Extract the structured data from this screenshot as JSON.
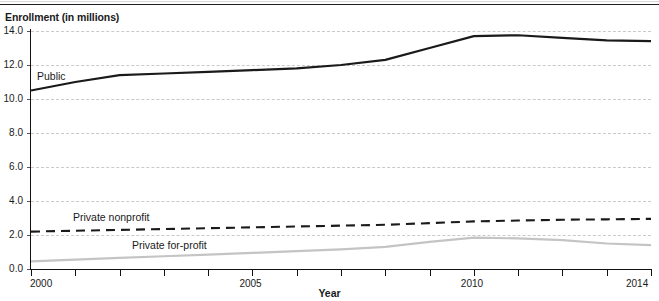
{
  "figure": {
    "y_axis_caption": "Enrollment (in millions)",
    "x_axis_caption": "Year"
  },
  "series_labels": {
    "public": "Public",
    "private_nonprofit": "Private nonprofit",
    "private_for_profit": "Private for-profit"
  },
  "axis": {
    "y_ticks": [
      "0.0",
      "2.0",
      "4.0",
      "6.0",
      "8.0",
      "10.0",
      "12.0",
      "14.0"
    ],
    "x_ticks_labeled": [
      "2000",
      "2005",
      "2010",
      "2014"
    ]
  },
  "colors": {
    "public_line": "#1a1a1a",
    "nonprofit_line": "#1a1a1a",
    "forprofit_line": "#c4c4c4",
    "gridline": "#c9c9c9",
    "axis": "#111111",
    "text": "#1a1a1a"
  },
  "chart_data": {
    "type": "line",
    "title": "Enrollment (in millions)",
    "xlabel": "Year",
    "ylabel": "Enrollment (in millions)",
    "xlim": [
      2000,
      2014
    ],
    "ylim": [
      0.0,
      14.0
    ],
    "ytick_step": 2.0,
    "grid": true,
    "legend": "inline-labels",
    "x": [
      2000,
      2001,
      2002,
      2003,
      2004,
      2005,
      2006,
      2007,
      2008,
      2009,
      2010,
      2011,
      2012,
      2013,
      2014
    ],
    "series": [
      {
        "name": "Public",
        "style": "solid",
        "color": "#1a1a1a",
        "values": [
          10.5,
          11.0,
          11.4,
          11.5,
          11.6,
          11.7,
          11.8,
          12.0,
          12.3,
          13.0,
          13.7,
          13.75,
          13.6,
          13.45,
          13.4
        ]
      },
      {
        "name": "Private nonprofit",
        "style": "dashed",
        "color": "#1a1a1a",
        "values": [
          2.2,
          2.25,
          2.3,
          2.35,
          2.4,
          2.45,
          2.5,
          2.55,
          2.6,
          2.7,
          2.8,
          2.85,
          2.9,
          2.92,
          2.95
        ]
      },
      {
        "name": "Private for-profit",
        "style": "solid",
        "color": "#c4c4c4",
        "values": [
          0.45,
          0.55,
          0.65,
          0.75,
          0.85,
          0.95,
          1.05,
          1.15,
          1.3,
          1.6,
          1.85,
          1.8,
          1.7,
          1.5,
          1.4
        ]
      }
    ]
  }
}
